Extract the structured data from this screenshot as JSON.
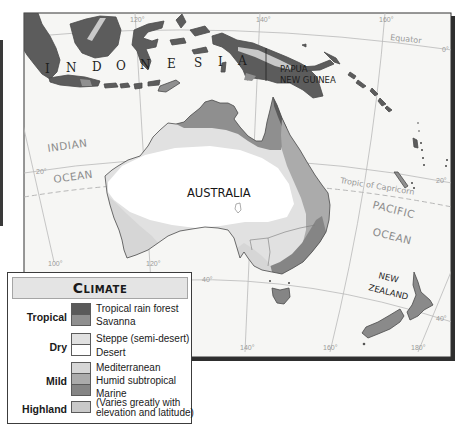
{
  "colors": {
    "ocean_bg": "#f6f6f4",
    "land_dark": "#5c5c5c",
    "tropical_rain_forest": "#5a5a5a",
    "savanna": "#8f8f8f",
    "steppe": "#e1e1e1",
    "desert": "#ffffff",
    "mediterranean": "#d6d6d6",
    "humid_subtropical": "#ababab",
    "marine": "#858585",
    "highland": "#c9c9c9",
    "nz_land": "#8a8a8a"
  },
  "map": {
    "labels": {
      "indonesia": [
        "I",
        "N",
        "D",
        "O",
        "N",
        "E",
        "S",
        "I",
        "A"
      ],
      "papua_new_guinea": [
        "PAPUA",
        "NEW GUINEA"
      ],
      "australia": "AUSTRALIA",
      "new_zealand": [
        "NEW",
        "ZEALAND"
      ],
      "indian_ocean": [
        "INDIAN",
        "OCEAN"
      ],
      "pacific_ocean": [
        "PACIFIC",
        "OCEAN"
      ],
      "equator": "Equator",
      "tropic_of_capricorn": "Tropic of Capricorn"
    },
    "grid_labels": {
      "lat_0": "0°",
      "lat_20_left": "20°",
      "lat_20_right": "20°",
      "lat_40_left": "40°",
      "lat_40_right": "40°",
      "lon_100": "100°",
      "lon_120_top": "120°",
      "lon_120_bottom": "120°",
      "lon_140_top": "140°",
      "lon_140_bottom": "140°",
      "lon_160_top": "160°",
      "lon_160_bottom": "160°",
      "lon_180": "180°"
    }
  },
  "legend": {
    "title": "Climate",
    "groups": [
      {
        "label": "Tropical",
        "items": [
          {
            "name": "Tropical rain forest",
            "color": "#5a5a5a"
          },
          {
            "name": "Savanna",
            "color": "#8f8f8f"
          }
        ]
      },
      {
        "label": "Dry",
        "items": [
          {
            "name": "Steppe (semi-desert)",
            "color": "#e1e1e1"
          },
          {
            "name": "Desert",
            "color": "#ffffff"
          }
        ]
      },
      {
        "label": "Mild",
        "items": [
          {
            "name": "Mediterranean",
            "color": "#d6d6d6"
          },
          {
            "name": "Humid subtropical",
            "color": "#ababab"
          },
          {
            "name": "Marine",
            "color": "#858585"
          }
        ]
      },
      {
        "label": "Highland",
        "items": [
          {
            "name": "(Varies greatly with",
            "color": "#c9c9c9"
          },
          {
            "name": "elevation and latitude)",
            "color": "#c9c9c9"
          }
        ]
      }
    ]
  }
}
